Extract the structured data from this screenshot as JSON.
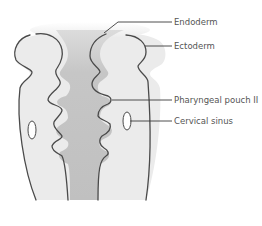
{
  "diagram": {
    "type": "anatomical",
    "labels": [
      {
        "id": "endoderm",
        "text": "Endoderm"
      },
      {
        "id": "ectoderm",
        "text": "Ectoderm"
      },
      {
        "id": "pharyngeal-pouch-ii",
        "text": "Pharyngeal pouch II"
      },
      {
        "id": "cervical-sinus",
        "text": "Cervical sinus"
      }
    ],
    "colors": {
      "background": "#ffffff",
      "ectoderm_fill": "#ebebeb",
      "endoderm_fill": "#c4c4c4",
      "outline": "#4a4a4a",
      "sinus_fill": "#ffffff",
      "label_text": "#555555"
    }
  }
}
